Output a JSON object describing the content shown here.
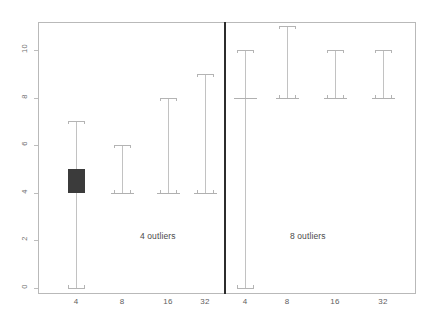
{
  "chart_data": {
    "type": "box",
    "title": "",
    "xlabel": "",
    "ylabel": "",
    "ylim": [
      -0.6,
      11.6
    ],
    "y_ticks": [
      0,
      2,
      4,
      6,
      8,
      10
    ],
    "y_tick_labels": [
      "0",
      "2",
      "4",
      "6",
      "8",
      "10"
    ],
    "grid": false,
    "legend": null,
    "categories": [
      "4",
      "8",
      "16",
      "32"
    ],
    "panels": [
      {
        "name": "4 outliers",
        "note": "4 outliers",
        "boxes": [
          {
            "category": "4",
            "lower_whisker": 0,
            "q1": 4,
            "median": 4,
            "q3": 5,
            "upper_whisker": 7,
            "filled": true
          },
          {
            "category": "8",
            "lower_whisker": 4,
            "q1": 4,
            "median": 4,
            "q3": 4,
            "upper_whisker": 6,
            "filled": false
          },
          {
            "category": "16",
            "lower_whisker": 4,
            "q1": 4,
            "median": 4,
            "q3": 4,
            "upper_whisker": 8,
            "filled": false
          },
          {
            "category": "32",
            "lower_whisker": 4,
            "q1": 4,
            "median": 4,
            "q3": 4,
            "upper_whisker": 9,
            "filled": false
          }
        ]
      },
      {
        "name": "8 outliers",
        "note": "8 outliers",
        "boxes": [
          {
            "category": "4",
            "lower_whisker": 0,
            "q1": 8,
            "median": 8,
            "q3": 8,
            "upper_whisker": 10,
            "filled": false
          },
          {
            "category": "8",
            "lower_whisker": 8,
            "q1": 8,
            "median": 8,
            "q3": 8,
            "upper_whisker": 11,
            "filled": false
          },
          {
            "category": "16",
            "lower_whisker": 8,
            "q1": 8,
            "median": 8,
            "q3": 8,
            "upper_whisker": 10,
            "filled": false
          },
          {
            "category": "32",
            "lower_whisker": 8,
            "q1": 8,
            "median": 8,
            "q3": 8,
            "upper_whisker": 10,
            "filled": false
          }
        ]
      }
    ],
    "colors": {
      "filled_box": "#3b3b3b",
      "outline": "#b4b4b4",
      "frame": "#b9b9b9",
      "divider": "#2c2c2c",
      "tick_text": "#5e5e5e",
      "background": "#ffffff"
    }
  },
  "geometry": {
    "frame": {
      "left": 38,
      "top": 22,
      "width": 378,
      "height": 272
    },
    "divider_x": 224,
    "y_axis": {
      "y_at_zero": 288,
      "px_per_unit": 23.8
    },
    "x_positions": [
      76,
      122,
      168,
      205,
      245,
      287,
      335,
      383
    ],
    "note_positions": [
      {
        "x": 140,
        "y": 231
      },
      {
        "x": 290,
        "y": 231
      }
    ],
    "ytick_label_x": 24,
    "xtick_label_y": 297
  }
}
